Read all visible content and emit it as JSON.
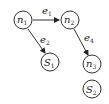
{
  "diagram": {
    "nodes": [
      {
        "id": "n1",
        "base": "n",
        "sub": "1",
        "cx": 23,
        "cy": 20
      },
      {
        "id": "n2",
        "base": "n",
        "sub": "2",
        "cx": 70,
        "cy": 20
      },
      {
        "id": "S1",
        "base": "S",
        "sub": "1",
        "cx": 50,
        "cy": 62
      },
      {
        "id": "n3",
        "base": "n",
        "sub": "3",
        "cx": 92,
        "cy": 64
      },
      {
        "id": "S2",
        "base": "S",
        "sub": "2",
        "cx": 92,
        "cy": 89
      }
    ],
    "edges": [
      {
        "id": "e1",
        "base": "e",
        "sub": "1",
        "from": "n1",
        "to": "n2"
      },
      {
        "id": "e2",
        "base": "e",
        "sub": "2",
        "from": "n1",
        "to": "S1"
      },
      {
        "id": "e4",
        "base": "e",
        "sub": "4",
        "from": "n2",
        "to": "n3"
      }
    ],
    "colors": {
      "stroke": "#333333",
      "background": "#ffffff"
    }
  }
}
